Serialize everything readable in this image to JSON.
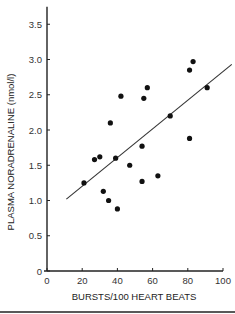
{
  "chart_data": {
    "type": "scatter",
    "title": "",
    "xlabel": "BURSTS/100 HEART BEATS",
    "ylabel": "PLASMA NORADRENALINE (nmol/l)",
    "xlim": [
      0,
      100
    ],
    "ylim": [
      0,
      3.75
    ],
    "x_ticks": [
      "0",
      "20",
      "40",
      "60",
      "80",
      "100"
    ],
    "x_tick_values": [
      0,
      20,
      40,
      60,
      80,
      100
    ],
    "y_ticks": [
      "0",
      "0.5",
      "1.0",
      "1.5",
      "2.0",
      "2.5",
      "3.0",
      "3.5"
    ],
    "y_tick_values": [
      0,
      0.5,
      1.0,
      1.5,
      2.0,
      2.5,
      3.0,
      3.5
    ],
    "grid": false,
    "legend": null,
    "series": [
      {
        "name": "subjects",
        "points": [
          [
            21,
            1.25
          ],
          [
            27,
            1.58
          ],
          [
            30,
            1.62
          ],
          [
            32,
            1.13
          ],
          [
            35,
            1.0
          ],
          [
            36,
            2.1
          ],
          [
            39,
            1.6
          ],
          [
            40,
            0.88
          ],
          [
            42,
            2.48
          ],
          [
            47,
            1.5
          ],
          [
            54,
            1.77
          ],
          [
            54,
            1.27
          ],
          [
            55,
            2.45
          ],
          [
            57,
            2.6
          ],
          [
            63,
            1.35
          ],
          [
            70,
            2.2
          ],
          [
            81,
            2.85
          ],
          [
            81,
            1.88
          ],
          [
            83,
            2.97
          ],
          [
            91,
            2.6
          ]
        ]
      }
    ],
    "regression_line": {
      "x1": 11,
      "y1": 1.02,
      "x2": 105,
      "y2": 2.93
    }
  }
}
